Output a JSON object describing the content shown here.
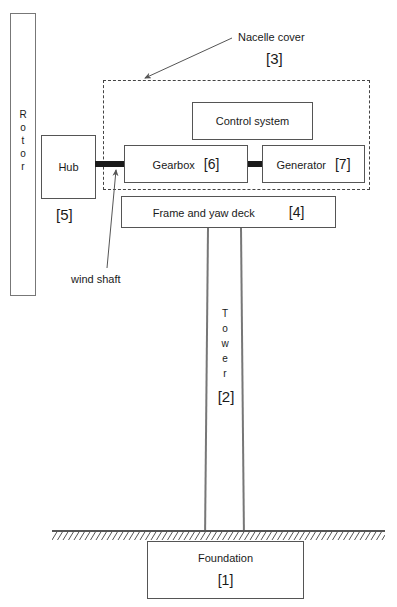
{
  "diagram": {
    "type": "block-diagram",
    "colors": {
      "stroke": "#555555",
      "shaft": "#1a1a1a",
      "text": "#1a1a1a",
      "background": "#ffffff"
    },
    "components": {
      "rotor": {
        "label": "Rotor",
        "letters": [
          "R",
          "o",
          "t",
          "o",
          "r"
        ],
        "orientation": "vertical"
      },
      "hub": {
        "label": "Hub",
        "ref": "[5]"
      },
      "nacelle_cover": {
        "label": "Nacelle cover",
        "ref": "[3]",
        "style": "dashed"
      },
      "control_system": {
        "label": "Control system",
        "ref": ""
      },
      "gearbox": {
        "label": "Gearbox",
        "ref": "[6]"
      },
      "generator": {
        "label": "Generator",
        "ref": "[7]"
      },
      "frame_and_yaw_deck": {
        "label": "Frame and yaw deck",
        "ref": "[4]"
      },
      "tower": {
        "label": "Tower",
        "letters": [
          "T",
          "o",
          "w",
          "e",
          "r"
        ],
        "ref": "[2]",
        "orientation": "vertical"
      },
      "foundation": {
        "label": "Foundation",
        "ref": "[1]"
      },
      "wind_shaft": {
        "label": "wind shaft"
      },
      "ground": {
        "label": "ground-hatching"
      }
    }
  }
}
